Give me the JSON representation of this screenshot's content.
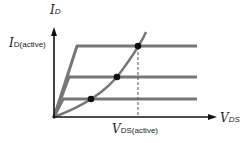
{
  "diagram": {
    "y_axis": {
      "symbol": "I",
      "subscript": "D"
    },
    "x_axis": {
      "symbol": "V",
      "subscript": "DS"
    },
    "y_marker": {
      "symbol": "I",
      "subscript": "D(active)"
    },
    "x_marker": {
      "symbol": "V",
      "subscript": "DS(active)"
    },
    "curves": [
      {
        "name": "upper-curve",
        "knee": [
          77,
          46
        ],
        "level_y": 46
      },
      {
        "name": "middle-curve",
        "knee": [
          69,
          77
        ],
        "level_y": 77
      },
      {
        "name": "lower-curve",
        "knee": [
          63,
          99
        ],
        "level_y": 99
      }
    ],
    "boundary_points": [
      [
        91,
        99
      ],
      [
        117,
        77
      ],
      [
        138,
        46
      ]
    ],
    "colors": {
      "curve": "#777777",
      "axis": "#111111",
      "point": "#111111",
      "dashed": "#555555"
    }
  }
}
